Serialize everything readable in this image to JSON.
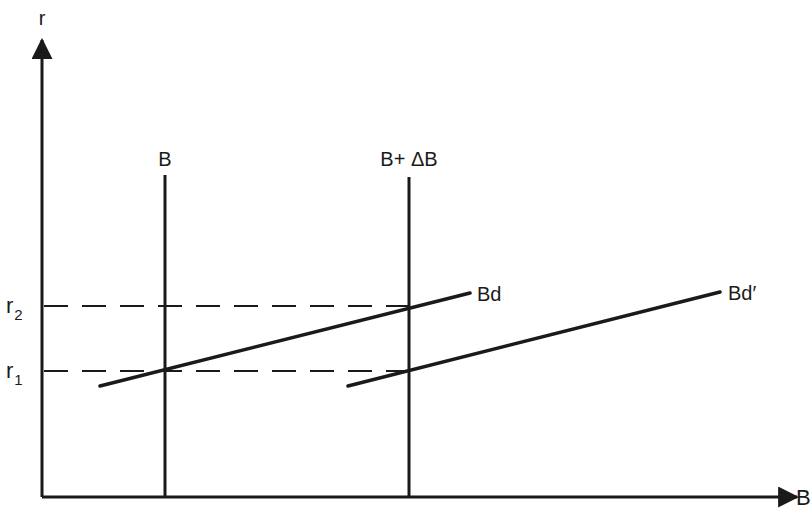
{
  "diagram": {
    "type": "economics supply-demand diagram (bond market)",
    "colors": {
      "ink": "#1a1a1a",
      "background": "#ffffff"
    },
    "axes": {
      "y": {
        "label": "r",
        "origin": [
          42,
          497
        ],
        "tip": [
          42,
          40
        ]
      },
      "x": {
        "label": "B",
        "origin": [
          42,
          497
        ],
        "tip": [
          797,
          497
        ]
      }
    },
    "supply_lines": [
      {
        "label": "B",
        "x": 165,
        "y_top": 175,
        "y_bottom": 497,
        "label_pos": [
          165,
          166
        ]
      },
      {
        "label": "B+ ΔB",
        "x": 409,
        "y_top": 177,
        "y_bottom": 497,
        "label_pos": [
          409,
          166
        ]
      }
    ],
    "demand_lines": [
      {
        "label": "Bd",
        "x1": 100,
        "y1": 386,
        "x2": 470,
        "y2": 293,
        "label_pos": [
          477,
          301
        ]
      },
      {
        "label": "Bd′",
        "x1": 348,
        "y1": 386,
        "x2": 720,
        "y2": 292,
        "label_pos": [
          728,
          300
        ]
      }
    ],
    "rate_levels": [
      {
        "label": "r",
        "subscript": "2",
        "y": 306,
        "x_end": 409
      },
      {
        "label": "r",
        "subscript": "1",
        "y": 371,
        "x_end": 409
      }
    ]
  }
}
